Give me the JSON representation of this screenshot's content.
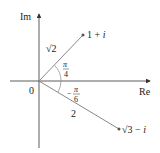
{
  "diagram": {
    "axes": {
      "real_label": "Re",
      "imag_label": "Im",
      "origin_label": "0"
    },
    "points": [
      {
        "label_base": "1 + ",
        "label_italic": "i",
        "modulus_label": "√2",
        "angle_num": "π",
        "angle_den": "4",
        "angle_sign": ""
      },
      {
        "label_base": "√3 − ",
        "label_italic": "i",
        "modulus_label": "2",
        "angle_num": "π",
        "angle_den": "6",
        "angle_sign": "−"
      }
    ],
    "colors": {
      "axis": "#333333",
      "vector": "#888888",
      "text": "#222222"
    }
  }
}
